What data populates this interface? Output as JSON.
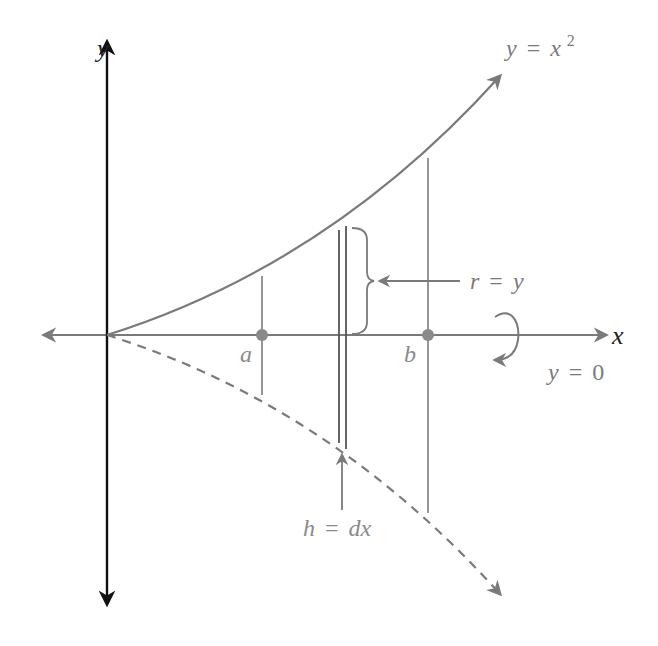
{
  "figure": {
    "colors": {
      "background": "#ffffff",
      "axis_y": "#111111",
      "gray_stroke": "#7a7a7a",
      "gray_text": "#8a8a8a",
      "dark_text": "#222222"
    },
    "axes": {
      "x_label": "x",
      "y_label": "y"
    },
    "curve": {
      "label_lhs": "y",
      "label_eq": "=",
      "label_rhs_base": "x",
      "label_rhs_exp": "2"
    },
    "reflected_curve": {
      "style": "dashed"
    },
    "points": {
      "a_label": "a",
      "b_label": "b"
    },
    "radius_label": {
      "lhs": "r",
      "eq": "=",
      "rhs": "y"
    },
    "height_label": {
      "lhs": "h",
      "eq": "=",
      "rhs": "dx"
    },
    "axis_of_rotation": {
      "lhs": "y",
      "eq": "=",
      "rhs": "0",
      "icon": "rotation-arrow-icon"
    }
  }
}
